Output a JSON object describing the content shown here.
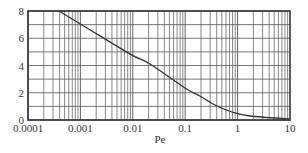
{
  "chart_data": {
    "type": "line",
    "title": "",
    "xlabel": "Pe",
    "ylabel": "",
    "xscale": "log",
    "xlim": [
      0.0001,
      10
    ],
    "ylim": [
      0,
      8
    ],
    "grid": true,
    "legend": null,
    "x_ticks": [
      {
        "value": 0.0001,
        "label": "0.0001"
      },
      {
        "value": 0.001,
        "label": "0.001"
      },
      {
        "value": 0.01,
        "label": "0.01"
      },
      {
        "value": 0.1,
        "label": "0.1"
      },
      {
        "value": 1,
        "label": "1"
      },
      {
        "value": 10,
        "label": "10"
      }
    ],
    "y_ticks": [
      {
        "value": 0,
        "label": "0"
      },
      {
        "value": 2,
        "label": "2"
      },
      {
        "value": 4,
        "label": "4"
      },
      {
        "value": 6,
        "label": "6"
      },
      {
        "value": 8,
        "label": "8"
      }
    ],
    "y_minor_gridlines": [
      1,
      3,
      5,
      7
    ],
    "series": [
      {
        "name": "curve",
        "color": "#333333",
        "x": [
          0.00039,
          0.00098,
          0.0089,
          0.0213,
          0.099,
          0.19,
          0.37,
          0.78,
          1.73,
          10
        ],
        "y": [
          8.0,
          7.07,
          4.84,
          4.11,
          2.35,
          1.76,
          1.1,
          0.59,
          0.29,
          0.07
        ]
      }
    ]
  },
  "colors": {
    "frame": "#333333",
    "grid": "#555555",
    "curve": "#333333",
    "text": "#333333",
    "background": "#ffffff"
  }
}
